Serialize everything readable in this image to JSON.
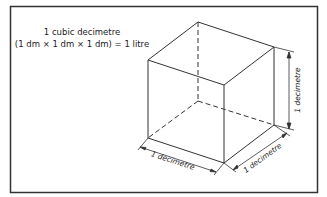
{
  "caption": {
    "line1": "1 cubic decimetre",
    "line2": "(1 dm  × 1 dm  × 1 dm) = 1 litre"
  },
  "dimensions": {
    "width_label": "1 decimetre",
    "depth_label": "1 decimetre",
    "height_label": "1 decimetre"
  },
  "colors": {
    "line": "#333333",
    "frame": "#333333",
    "background": "#ffffff"
  }
}
